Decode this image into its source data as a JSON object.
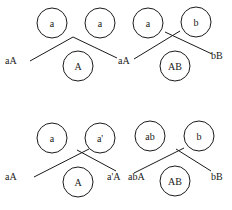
{
  "diagram": {
    "top": {
      "circles": [
        {
          "label": "a",
          "cx": 52,
          "cy": 23,
          "r": 15
        },
        {
          "label": "a",
          "cx": 100,
          "cy": 23,
          "r": 15
        },
        {
          "label": "a",
          "cx": 148,
          "cy": 23,
          "r": 15
        },
        {
          "label": "b",
          "cx": 196,
          "cy": 22,
          "r": 15
        },
        {
          "label": "A",
          "cx": 78,
          "cy": 66,
          "r": 15
        },
        {
          "label": "AB",
          "cx": 175,
          "cy": 66,
          "r": 15
        }
      ],
      "labels": [
        {
          "text": "aA",
          "x": 4,
          "y": 64
        },
        {
          "text": "aA",
          "x": 118,
          "y": 64
        },
        {
          "text": "bB",
          "x": 211,
          "y": 59
        }
      ]
    },
    "bottom": {
      "circles": [
        {
          "label": "a",
          "cx": 52,
          "cy": 138,
          "r": 15
        },
        {
          "label": "a'",
          "cx": 100,
          "cy": 138,
          "r": 15
        },
        {
          "label": "ab",
          "cx": 150,
          "cy": 136,
          "r": 15
        },
        {
          "label": "b",
          "cx": 199,
          "cy": 136,
          "r": 15
        },
        {
          "label": "A",
          "cx": 78,
          "cy": 182,
          "r": 15
        },
        {
          "label": "AB",
          "cx": 175,
          "cy": 181,
          "r": 15
        }
      ],
      "labels": [
        {
          "text": "aA",
          "x": 4,
          "y": 180
        },
        {
          "text": "a'A",
          "x": 107,
          "y": 180
        },
        {
          "text": "abA",
          "x": 128,
          "y": 180
        },
        {
          "text": "bB",
          "x": 211,
          "y": 180
        }
      ]
    }
  }
}
